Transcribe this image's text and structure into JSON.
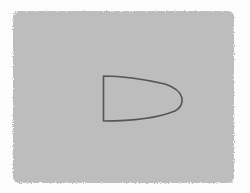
{
  "scene": {
    "background_color": "#ffffff",
    "panel": {
      "shape": "rounded-rectangle",
      "fill": "#bdbdbd",
      "x": 13,
      "y": 11,
      "width": 221,
      "height": 172
    },
    "outline_shape": {
      "shape": "bullet-d-shape",
      "stroke": "#555555",
      "stroke_width": 1.6,
      "path": "M103.5 76 L103.5 121 Q150 121 175 111 Q183 107 182 98 Q180 89 165 84 Q130 76 103.5 76 Z"
    }
  }
}
